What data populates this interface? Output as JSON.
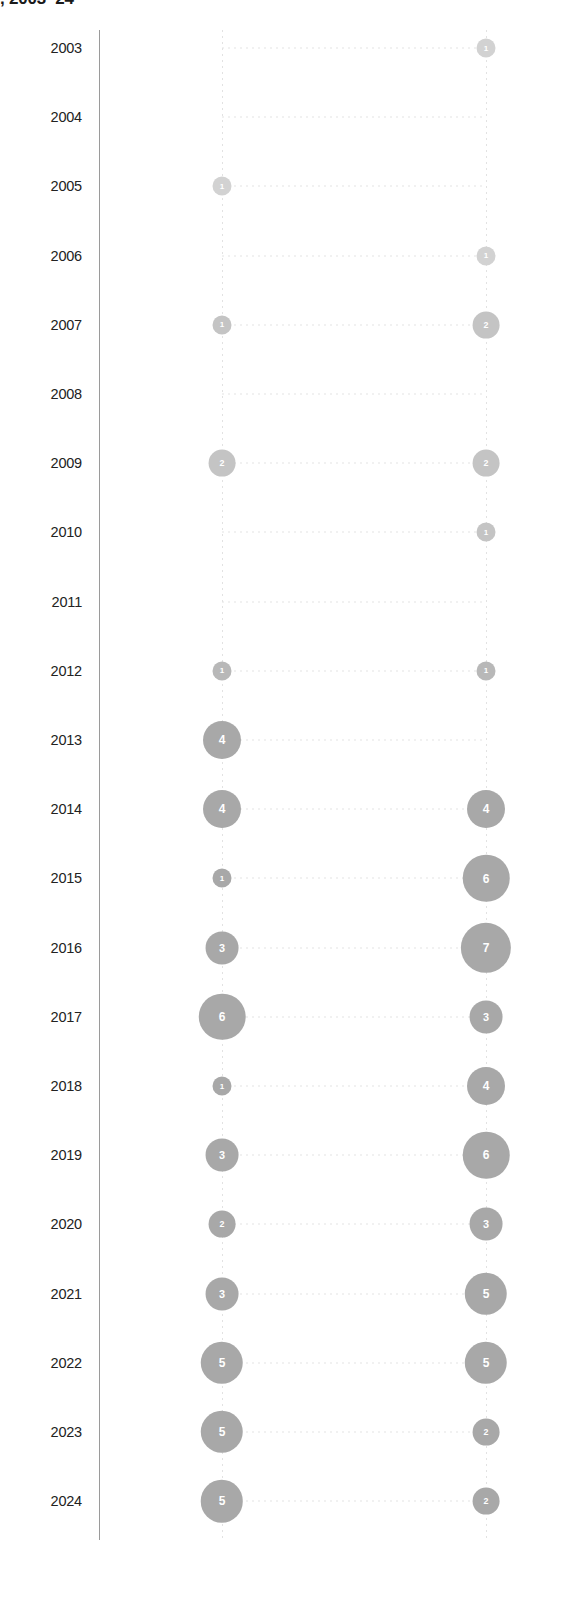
{
  "title": ", 2003–24",
  "axis": {
    "year_labels": [
      "2003",
      "2004",
      "2005",
      "2006",
      "2007",
      "2008",
      "2009",
      "2010",
      "2011",
      "2012",
      "2013",
      "2014",
      "2015",
      "2016",
      "2017",
      "2018",
      "2019",
      "2020",
      "2021",
      "2022",
      "2023",
      "2024"
    ]
  },
  "colors": {
    "bubble_fill": "#a8a8a8",
    "bubble_label": "#ffffff",
    "axis_line": "#9a9a9a",
    "grid_dotted": "#e4e4e4",
    "year_label": "#222222",
    "title": "#1a1a1a"
  },
  "chart_data": {
    "type": "scatter",
    "title": ", 2003–24",
    "xlabel": "",
    "ylabel": "",
    "grid": true,
    "legend_position": "none",
    "categories": [
      "2003",
      "2004",
      "2005",
      "2006",
      "2007",
      "2008",
      "2009",
      "2010",
      "2011",
      "2012",
      "2013",
      "2014",
      "2015",
      "2016",
      "2017",
      "2018",
      "2019",
      "2020",
      "2021",
      "2022",
      "2023",
      "2024"
    ],
    "series": [
      {
        "name": "left-series",
        "x_position": 222,
        "values": [
          null,
          null,
          1,
          null,
          1,
          null,
          2,
          null,
          null,
          1,
          4,
          4,
          1,
          3,
          6,
          1,
          3,
          2,
          3,
          5,
          5,
          5
        ]
      },
      {
        "name": "right-series",
        "x_position": 486,
        "values": [
          1,
          null,
          null,
          1,
          2,
          null,
          2,
          1,
          null,
          1,
          null,
          4,
          6,
          7,
          3,
          4,
          6,
          3,
          5,
          5,
          2,
          2
        ]
      }
    ],
    "value_range": [
      1,
      7
    ],
    "bubble_labels": "value printed inside each circle"
  },
  "rows": [
    {
      "year": "2003",
      "left": null,
      "right": 1
    },
    {
      "year": "2004",
      "left": null,
      "right": null
    },
    {
      "year": "2005",
      "left": 1,
      "right": null
    },
    {
      "year": "2006",
      "left": null,
      "right": 1
    },
    {
      "year": "2007",
      "left": 1,
      "right": 2
    },
    {
      "year": "2008",
      "left": null,
      "right": null
    },
    {
      "year": "2009",
      "left": 2,
      "right": 2
    },
    {
      "year": "2010",
      "left": null,
      "right": 1
    },
    {
      "year": "2011",
      "left": null,
      "right": null
    },
    {
      "year": "2012",
      "left": 1,
      "right": 1
    },
    {
      "year": "2013",
      "left": 4,
      "right": null
    },
    {
      "year": "2014",
      "left": 4,
      "right": 4
    },
    {
      "year": "2015",
      "left": 1,
      "right": 6
    },
    {
      "year": "2016",
      "left": 3,
      "right": 7
    },
    {
      "year": "2017",
      "left": 6,
      "right": 3
    },
    {
      "year": "2018",
      "left": 1,
      "right": 4
    },
    {
      "year": "2019",
      "left": 3,
      "right": 6
    },
    {
      "year": "2020",
      "left": 2,
      "right": 3
    },
    {
      "year": "2021",
      "left": 3,
      "right": 5
    },
    {
      "year": "2022",
      "left": 5,
      "right": 5
    },
    {
      "year": "2023",
      "left": 5,
      "right": 2
    },
    {
      "year": "2024",
      "left": 5,
      "right": 2
    }
  ]
}
